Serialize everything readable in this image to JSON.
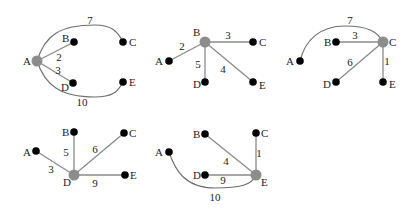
{
  "colors": {
    "center_node": "#8c8c8c",
    "leaf_node": "#000000",
    "straight_edge": "#8a8a8a",
    "curved_edge": "#6e6e6e",
    "text": "#222222"
  },
  "panels": [
    {
      "center": "A",
      "nodes": [
        {
          "id": "A",
          "x": 37,
          "y": 61,
          "label": "A",
          "lx": 23,
          "ly": 65,
          "center": true
        },
        {
          "id": "B",
          "x": 74,
          "y": 42,
          "label": "B",
          "lx": 62,
          "ly": 42
        },
        {
          "id": "C",
          "x": 123,
          "y": 42,
          "label": "C",
          "lx": 129,
          "ly": 46
        },
        {
          "id": "D",
          "x": 73,
          "y": 83,
          "label": "D",
          "lx": 61,
          "ly": 91
        },
        {
          "id": "E",
          "x": 123,
          "y": 82,
          "label": "E",
          "lx": 129,
          "ly": 86
        }
      ],
      "edges": [
        {
          "from": "A",
          "to": "B",
          "weight": "2",
          "wx": 59,
          "wy": 61,
          "type": "line"
        },
        {
          "from": "A",
          "to": "D",
          "weight": "3",
          "wx": 58,
          "wy": 74,
          "type": "line"
        },
        {
          "from": "A",
          "to": "C",
          "weight": "7",
          "wx": 90,
          "wy": 24,
          "type": "curve",
          "path": "M37,61 C45,35 60,25 95,25 C112,25 118,32 123,42"
        },
        {
          "from": "A",
          "to": "E",
          "weight": "10",
          "wx": 82,
          "wy": 106,
          "type": "curve",
          "path": "M37,61 C45,85 60,97 95,97 C112,97 118,92 123,82"
        }
      ]
    },
    {
      "center": "B",
      "nodes": [
        {
          "id": "B",
          "x": 205,
          "y": 42,
          "label": "B",
          "lx": 193,
          "ly": 36,
          "center": true
        },
        {
          "id": "A",
          "x": 169,
          "y": 61,
          "label": "A",
          "lx": 155,
          "ly": 65
        },
        {
          "id": "C",
          "x": 253,
          "y": 42,
          "label": "C",
          "lx": 259,
          "ly": 46
        },
        {
          "id": "D",
          "x": 205,
          "y": 82,
          "label": "D",
          "lx": 193,
          "ly": 88
        },
        {
          "id": "E",
          "x": 253,
          "y": 82,
          "label": "E",
          "lx": 259,
          "ly": 89
        }
      ],
      "edges": [
        {
          "from": "B",
          "to": "A",
          "weight": "2",
          "wx": 182,
          "wy": 50,
          "type": "line"
        },
        {
          "from": "B",
          "to": "C",
          "weight": "3",
          "wx": 228,
          "wy": 39,
          "type": "line"
        },
        {
          "from": "B",
          "to": "D",
          "weight": "5",
          "wx": 198,
          "wy": 68,
          "type": "line"
        },
        {
          "from": "B",
          "to": "E",
          "weight": "4",
          "wx": 223,
          "wy": 73,
          "type": "line"
        }
      ]
    },
    {
      "center": "C",
      "nodes": [
        {
          "id": "C",
          "x": 383,
          "y": 42,
          "label": "C",
          "lx": 389,
          "ly": 46,
          "center": true
        },
        {
          "id": "A",
          "x": 300,
          "y": 61,
          "label": "A",
          "lx": 286,
          "ly": 65
        },
        {
          "id": "B",
          "x": 336,
          "y": 42,
          "label": "B",
          "lx": 324,
          "ly": 46
        },
        {
          "id": "D",
          "x": 336,
          "y": 82,
          "label": "D",
          "lx": 323,
          "ly": 88
        },
        {
          "id": "E",
          "x": 383,
          "y": 82,
          "label": "E",
          "lx": 389,
          "ly": 88
        }
      ],
      "edges": [
        {
          "from": "C",
          "to": "B",
          "weight": "3",
          "wx": 355,
          "wy": 39,
          "type": "line"
        },
        {
          "from": "C",
          "to": "D",
          "weight": "6",
          "wx": 350,
          "wy": 66,
          "type": "line"
        },
        {
          "from": "C",
          "to": "E",
          "weight": "1",
          "wx": 387,
          "wy": 65,
          "type": "line"
        },
        {
          "from": "C",
          "to": "A",
          "weight": "7",
          "wx": 350,
          "wy": 24,
          "type": "curve",
          "path": "M300,61 C305,40 320,26 345,26 C368,26 378,32 383,42"
        }
      ]
    },
    {
      "center": "D",
      "nodes": [
        {
          "id": "D",
          "x": 74,
          "y": 175,
          "label": "D",
          "lx": 63,
          "ly": 186,
          "center": true
        },
        {
          "id": "A",
          "x": 36,
          "y": 151,
          "label": "A",
          "lx": 23,
          "ly": 156
        },
        {
          "id": "B",
          "x": 74,
          "y": 132,
          "label": "B",
          "lx": 62,
          "ly": 136
        },
        {
          "id": "C",
          "x": 124,
          "y": 133,
          "label": "C",
          "lx": 129,
          "ly": 137
        },
        {
          "id": "E",
          "x": 125,
          "y": 175,
          "label": "E",
          "lx": 130,
          "ly": 179
        }
      ],
      "edges": [
        {
          "from": "D",
          "to": "A",
          "weight": "3",
          "wx": 51,
          "wy": 173,
          "type": "line"
        },
        {
          "from": "D",
          "to": "B",
          "weight": "5",
          "wx": 66,
          "wy": 156,
          "type": "line"
        },
        {
          "from": "D",
          "to": "C",
          "weight": "6",
          "wx": 95,
          "wy": 153,
          "type": "line"
        },
        {
          "from": "D",
          "to": "E",
          "weight": "9",
          "wx": 95,
          "wy": 187,
          "type": "line"
        }
      ]
    },
    {
      "center": "E",
      "nodes": [
        {
          "id": "E",
          "x": 256,
          "y": 175,
          "label": "E",
          "lx": 261,
          "ly": 186,
          "center": true
        },
        {
          "id": "A",
          "x": 169,
          "y": 152,
          "label": "A",
          "lx": 155,
          "ly": 156
        },
        {
          "id": "B",
          "x": 205,
          "y": 134,
          "label": "B",
          "lx": 193,
          "ly": 138
        },
        {
          "id": "C",
          "x": 256,
          "y": 133,
          "label": "C",
          "lx": 261,
          "ly": 137
        },
        {
          "id": "D",
          "x": 205,
          "y": 175,
          "label": "D",
          "lx": 193,
          "ly": 179
        }
      ],
      "edges": [
        {
          "from": "E",
          "to": "B",
          "weight": "4",
          "wx": 226,
          "wy": 165,
          "type": "line"
        },
        {
          "from": "E",
          "to": "C",
          "weight": "1",
          "wx": 259,
          "wy": 157,
          "type": "line"
        },
        {
          "from": "E",
          "to": "D",
          "weight": "9",
          "wx": 223,
          "wy": 184,
          "type": "line"
        },
        {
          "from": "E",
          "to": "A",
          "weight": "10",
          "wx": 215,
          "wy": 201,
          "type": "curve",
          "path": "M169,152 C175,170 185,188 215,188 C240,188 252,185 256,175"
        }
      ]
    }
  ]
}
